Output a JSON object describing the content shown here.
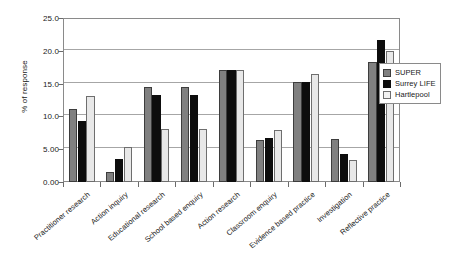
{
  "chart_data": {
    "type": "bar",
    "title": "",
    "xlabel": "",
    "ylabel": "% of response",
    "ylim": [
      0,
      25
    ],
    "ytick_labels": [
      "0.00",
      "5.00",
      "10.0",
      "15.0",
      "20.0",
      "25.0"
    ],
    "ytick_values": [
      0,
      5,
      10,
      15,
      20,
      25
    ],
    "grid": true,
    "legend_position": "right",
    "categories": [
      "Practitioner research",
      "Action inquiry",
      "Educational research",
      "School based enquiry",
      "Action research",
      "Classroom enquiry",
      "Evidence based practice",
      "Investigation",
      "Reflective practice"
    ],
    "series": [
      {
        "name": "SUPER",
        "color": "#808080",
        "values": [
          11.2,
          1.5,
          14.5,
          14.5,
          17.0,
          6.4,
          15.3,
          6.6,
          18.3
        ]
      },
      {
        "name": "Surrey LIFE",
        "color": "#0d0d0d",
        "values": [
          9.3,
          3.5,
          13.3,
          13.3,
          17.1,
          6.7,
          15.2,
          4.3,
          21.6
        ]
      },
      {
        "name": "Hartlepool",
        "color": "#e8e8e8",
        "values": [
          13.1,
          5.3,
          8.1,
          8.1,
          17.0,
          7.9,
          16.5,
          3.4,
          20.0
        ]
      }
    ]
  }
}
